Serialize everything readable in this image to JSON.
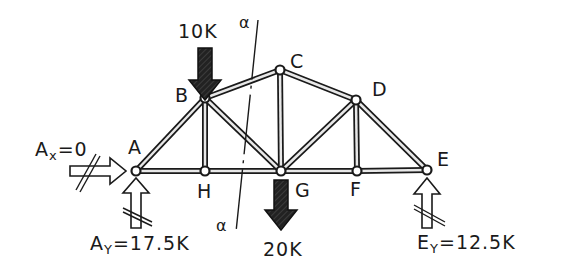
{
  "diagram": {
    "type": "truss",
    "title": "",
    "colors": {
      "ink": "#1a1a1a",
      "background": "#ffffff",
      "member_fill": "#e8e8e8"
    },
    "nodes": [
      {
        "id": "A",
        "label": "A",
        "x": 136,
        "y": 171
      },
      {
        "id": "B",
        "label": "B",
        "x": 205,
        "y": 98
      },
      {
        "id": "C",
        "label": "C",
        "x": 280,
        "y": 70
      },
      {
        "id": "D",
        "label": "D",
        "x": 356,
        "y": 100
      },
      {
        "id": "E",
        "label": "E",
        "x": 427,
        "y": 170
      },
      {
        "id": "F",
        "label": "F",
        "x": 357,
        "y": 171
      },
      {
        "id": "G",
        "label": "G",
        "x": 281,
        "y": 171
      },
      {
        "id": "H",
        "label": "H",
        "x": 205,
        "y": 171
      }
    ],
    "members": [
      [
        "A",
        "B"
      ],
      [
        "B",
        "C"
      ],
      [
        "C",
        "D"
      ],
      [
        "D",
        "E"
      ],
      [
        "A",
        "H"
      ],
      [
        "H",
        "G"
      ],
      [
        "G",
        "F"
      ],
      [
        "F",
        "E"
      ],
      [
        "B",
        "H"
      ],
      [
        "B",
        "G"
      ],
      [
        "C",
        "G"
      ],
      [
        "G",
        "D"
      ],
      [
        "D",
        "F"
      ]
    ],
    "loads": [
      {
        "node": "B",
        "label": "10K",
        "direction": "down",
        "style": "filled"
      },
      {
        "node": "G",
        "label": "20K",
        "direction": "down",
        "style": "filled"
      }
    ],
    "reactions": [
      {
        "node": "A",
        "label_main": "A",
        "label_sub": "x",
        "label_value": "=0",
        "direction": "right",
        "style": "outline-crossed"
      },
      {
        "node": "A",
        "label_main": "A",
        "label_sub": "Y",
        "label_value": "=17.5K",
        "direction": "up",
        "style": "outline-crossed"
      },
      {
        "node": "E",
        "label_main": "E",
        "label_sub": "Y",
        "label_value": "=12.5K",
        "direction": "up",
        "style": "outline-crossed"
      }
    ],
    "section_cut": {
      "label_top": "α",
      "label_bottom": "α",
      "from": [
        258,
        20
      ],
      "to": [
        236,
        232
      ]
    }
  }
}
